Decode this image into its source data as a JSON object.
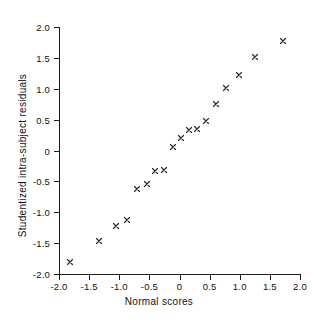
{
  "chart_data": {
    "type": "scatter",
    "title": "",
    "xlabel": "Normal scores",
    "ylabel": "Studentized intra-subject residuals",
    "xlim": [
      -2.0,
      2.0
    ],
    "ylim": [
      -2.0,
      2.0
    ],
    "grid": false,
    "legend": null,
    "marker": "x",
    "marker_color": "#2b2b2b",
    "xticks": [
      -2.0,
      -1.5,
      -1.0,
      -0.5,
      0,
      0.5,
      1.0,
      1.5,
      2.0
    ],
    "xtick_labels": [
      "-2.0",
      "-1.5",
      "-1.0",
      "-0.5",
      "0",
      "0.5",
      "1.0",
      "1.5",
      "2.0"
    ],
    "yticks": [
      2.0,
      1.5,
      1.0,
      0.5,
      0,
      -0.5,
      -1.0,
      -1.5,
      -2.0
    ],
    "ytick_labels": [
      "2.0",
      "1.5",
      "1.0",
      "0.5",
      "0",
      "-0.5",
      "-1.0",
      "-1.5",
      "-2.0"
    ],
    "points": [
      {
        "x": -1.82,
        "y": -1.8
      },
      {
        "x": -1.34,
        "y": -1.47
      },
      {
        "x": -1.05,
        "y": -1.23
      },
      {
        "x": -0.87,
        "y": -1.13
      },
      {
        "x": -0.7,
        "y": -0.62
      },
      {
        "x": -0.54,
        "y": -0.55
      },
      {
        "x": -0.4,
        "y": -0.33
      },
      {
        "x": -0.25,
        "y": -0.31
      },
      {
        "x": -0.11,
        "y": 0.05
      },
      {
        "x": 0.03,
        "y": 0.2
      },
      {
        "x": 0.16,
        "y": 0.34
      },
      {
        "x": 0.29,
        "y": 0.35
      },
      {
        "x": 0.44,
        "y": 0.47
      },
      {
        "x": 0.6,
        "y": 0.75
      },
      {
        "x": 0.77,
        "y": 1.01
      },
      {
        "x": 0.99,
        "y": 1.22
      },
      {
        "x": 1.25,
        "y": 1.52
      },
      {
        "x": 1.72,
        "y": 1.78
      }
    ]
  },
  "axes": {
    "x_title": "Normal scores",
    "y_title": "Studentized intra-subject residuals"
  }
}
